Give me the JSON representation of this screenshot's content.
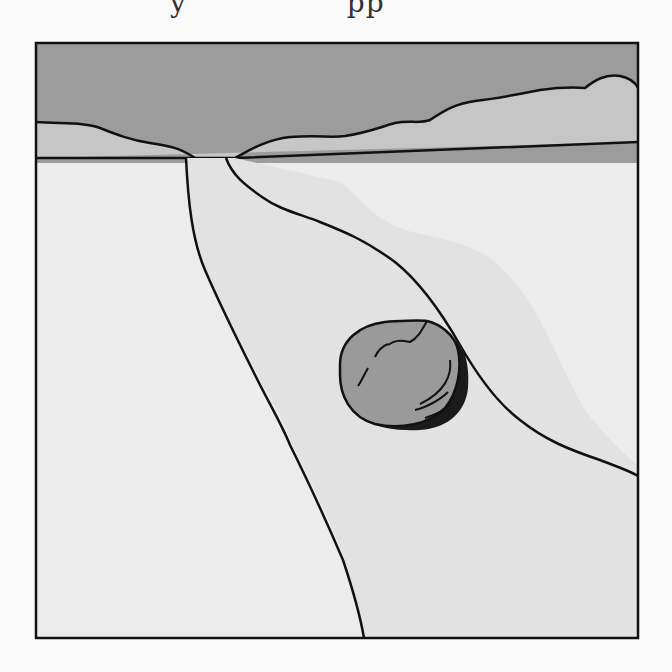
{
  "page": {
    "partial_heading_text": "y",
    "partial_heading_text_2": "pp"
  },
  "figure": {
    "title": "",
    "frame": {
      "x": 36,
      "y": 43,
      "width": 602,
      "height": 595
    },
    "colors": {
      "sky": "#9c9c9c",
      "hills": "#c6c6c6",
      "ground": "#ececec",
      "road": "#e2e2e2",
      "rock": "#9a9a9a",
      "rock_shadow": "#1a1a1a",
      "outline": "#111111"
    },
    "elements": [
      {
        "name": "sky",
        "label": "Sky"
      },
      {
        "name": "hills",
        "label": "Distant hills"
      },
      {
        "name": "horizon",
        "label": "Horizon line"
      },
      {
        "name": "road",
        "label": "Road"
      },
      {
        "name": "rock",
        "label": "Rock on road"
      }
    ]
  }
}
